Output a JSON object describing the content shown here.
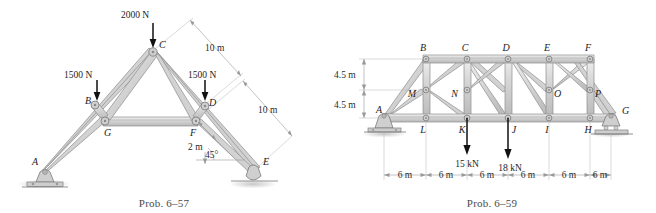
{
  "sheet": {
    "title": "Truss analysis problem figures",
    "background_color": "#ffffff"
  },
  "figures": [
    {
      "id": "prob-6-57",
      "caption": "Prob. 6–57",
      "type": "roof-truss-elevation",
      "joint_labels": [
        "A",
        "B",
        "C",
        "D",
        "E",
        "F",
        "G"
      ],
      "loads": [
        {
          "label": "2000 N",
          "at_joint": "C",
          "direction": "down"
        },
        {
          "label": "1500 N",
          "at_joint": "B",
          "direction": "down"
        },
        {
          "label": "1500 N",
          "at_joint": "D",
          "direction": "down"
        }
      ],
      "dimensions": [
        {
          "label": "10 m",
          "span": "C to D (upper right rafter)"
        },
        {
          "label": "10 m",
          "span": "D to E (lower right rafter)"
        },
        {
          "label": "2 m",
          "span": "F to rafter offset"
        },
        {
          "label": "45°",
          "span": "rafter inclination at E"
        }
      ],
      "supports": [
        {
          "at_joint": "A",
          "kind": "pin"
        },
        {
          "at_joint": "E",
          "kind": "roller"
        }
      ]
    },
    {
      "id": "prob-6-59",
      "caption": "Prob. 6–59",
      "type": "bridge-truss-elevation",
      "joint_labels_top": [
        "B",
        "C",
        "D",
        "E",
        "F"
      ],
      "joint_labels_mid": [
        "M",
        "N",
        "O",
        "P"
      ],
      "joint_labels_bottom": [
        "A",
        "L",
        "K",
        "J",
        "I",
        "H",
        "G"
      ],
      "loads": [
        {
          "label": "15 kN",
          "at_joint": "K",
          "direction": "down"
        },
        {
          "label": "18 kN",
          "at_joint": "J",
          "direction": "down"
        }
      ],
      "height_dimensions": [
        {
          "label": "4.5 m",
          "span": "upper chord to mid chord"
        },
        {
          "label": "4.5 m",
          "span": "mid chord to lower chord"
        }
      ],
      "panel_dimensions": [
        {
          "label": "6 m"
        },
        {
          "label": "6 m"
        },
        {
          "label": "6 m"
        },
        {
          "label": "6 m"
        },
        {
          "label": "6 m"
        },
        {
          "label": "6 m"
        }
      ],
      "supports": [
        {
          "at_joint": "A",
          "kind": "pin"
        },
        {
          "at_joint": "G",
          "kind": "roller"
        }
      ]
    }
  ],
  "colors": {
    "member_fill_light": "#e2e2e2",
    "member_fill_mid": "#c9c9c9",
    "member_stroke": "#8c8c8c",
    "arrow": "#111111",
    "dimension_line": "#9a9a9a",
    "text": "#1c1c1c",
    "caption_text": "#4a4a4a"
  }
}
